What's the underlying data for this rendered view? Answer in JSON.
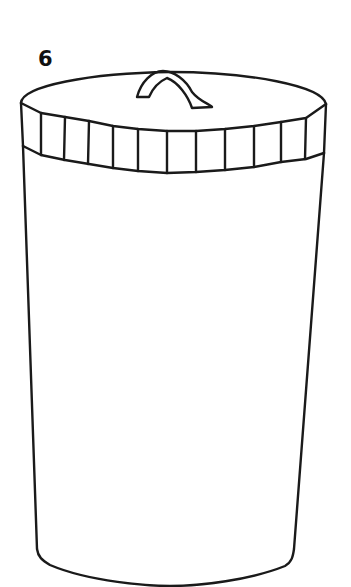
{
  "figure": {
    "label": "6",
    "colors": {
      "background": "#ffffff",
      "line": "#1a1a1a"
    },
    "band_segments": 12
  }
}
